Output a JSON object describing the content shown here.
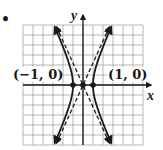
{
  "chart_data": {
    "type": "line",
    "title": "",
    "xlabel": "x",
    "ylabel": "y",
    "xlim": [
      -6,
      6
    ],
    "ylim": [
      -6,
      6
    ],
    "grid": true,
    "grid_step": 1,
    "series": [
      {
        "name": "hyperbola",
        "style": "solid",
        "equation": "x^2 - y^2/b^2 = 1",
        "b": 2.2,
        "branches": [
          "left",
          "right"
        ],
        "arrows": true
      },
      {
        "name": "asymptote-positive",
        "style": "dashed",
        "equation": "y = 2.2x",
        "arrows": true
      },
      {
        "name": "asymptote-negative",
        "style": "dashed",
        "equation": "y = -2.2x",
        "arrows": true
      }
    ],
    "points": [
      {
        "x": -1,
        "y": 0,
        "label": "(−1, 0)"
      },
      {
        "x": 0,
        "y": 0,
        "label": ""
      },
      {
        "x": 1,
        "y": 0,
        "label": "(1, 0)"
      }
    ],
    "annotations": [
      "(−1, 0)",
      "(1, 0)"
    ]
  },
  "labels": {
    "bullet": "•",
    "x_axis": "x",
    "y_axis": "y",
    "vertex_left": "(−1, 0)",
    "vertex_right": "(1, 0)"
  },
  "colors": {
    "ink": "#1a1a1a",
    "grid": "#9a9a9a"
  }
}
